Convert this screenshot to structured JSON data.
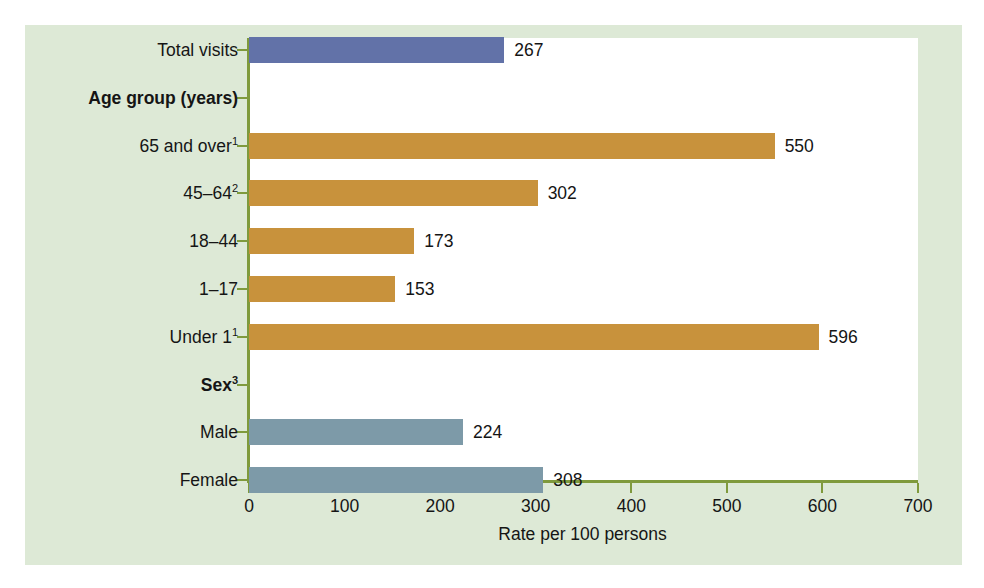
{
  "chart_data": {
    "type": "bar",
    "orientation": "horizontal",
    "title": "",
    "subtitle": "",
    "xlabel": "Rate per 100 persons",
    "ylabel": "",
    "xlim": [
      0,
      700
    ],
    "xticks": [
      0,
      100,
      200,
      300,
      400,
      500,
      600,
      700
    ],
    "xtick_labels": [
      "0",
      "100",
      "200",
      "300",
      "400",
      "500",
      "600",
      "700"
    ],
    "grid": false,
    "legend": false,
    "categories": [
      "Total visits",
      "Age group (years)",
      "65 and over1",
      "45–64 2",
      "18–44",
      "1–17",
      "Under 1 1",
      "Sex3",
      "Male",
      "Female"
    ],
    "values": [
      267,
      null,
      550,
      302,
      173,
      153,
      596,
      null,
      224,
      308
    ],
    "value_labels": [
      "267",
      "",
      "550",
      "302",
      "173",
      "153",
      "596",
      "",
      "224",
      "308"
    ],
    "rows": [
      {
        "label": "Total visits",
        "label_main": "Total visits",
        "superscript": "",
        "is_header": false,
        "value": 267,
        "value_label": "267",
        "color": "#6272a8",
        "series": "Total"
      },
      {
        "label": "Age group (years)",
        "label_main": "Age group (years)",
        "superscript": "",
        "is_header": true,
        "value": null,
        "value_label": "",
        "color": "",
        "series": ""
      },
      {
        "label": "65 and over1",
        "label_main": "65 and over",
        "superscript": "1",
        "is_header": false,
        "value": 550,
        "value_label": "550",
        "color": "#c8923c",
        "series": "Age group"
      },
      {
        "label": "45–64 2",
        "label_main": "45–64",
        "superscript": "2",
        "is_header": false,
        "value": 302,
        "value_label": "302",
        "color": "#c8923c",
        "series": "Age group"
      },
      {
        "label": "18–44",
        "label_main": "18–44",
        "superscript": "",
        "is_header": false,
        "value": 173,
        "value_label": "173",
        "color": "#c8923c",
        "series": "Age group"
      },
      {
        "label": "1–17",
        "label_main": "1–17",
        "superscript": "",
        "is_header": false,
        "value": 153,
        "value_label": "153",
        "color": "#c8923c",
        "series": "Age group"
      },
      {
        "label": "Under 1 1",
        "label_main": "Under 1",
        "superscript": "1",
        "is_header": false,
        "value": 596,
        "value_label": "596",
        "color": "#c8923c",
        "series": "Age group"
      },
      {
        "label": "Sex3",
        "label_main": "Sex",
        "superscript": "3",
        "is_header": true,
        "value": null,
        "value_label": "",
        "color": "",
        "series": ""
      },
      {
        "label": "Male",
        "label_main": "Male",
        "superscript": "",
        "is_header": false,
        "value": 224,
        "value_label": "224",
        "color": "#7d9aa8",
        "series": "Sex"
      },
      {
        "label": "Female",
        "label_main": "Female",
        "superscript": "",
        "is_header": false,
        "value": 308,
        "value_label": "308",
        "color": "#7d9aa8",
        "series": "Sex"
      }
    ]
  },
  "colors": {
    "background": "#ffffff",
    "panel": "#dde9d6",
    "plot_area": "#ffffff",
    "axis": "#7f9a3c",
    "text": "#151515",
    "bar_total": "#6272a8",
    "bar_age": "#c8923c",
    "bar_sex": "#7d9aa8"
  },
  "axis": {
    "x_title": "Rate per 100 persons",
    "tick_labels": [
      "0",
      "100",
      "200",
      "300",
      "400",
      "500",
      "600",
      "700"
    ]
  }
}
